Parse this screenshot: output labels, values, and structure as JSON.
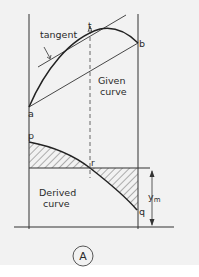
{
  "diagram": {
    "labels": {
      "tangent": "tangent",
      "t": "t",
      "b": "b",
      "a": "a",
      "given_line1": "Given",
      "given_line2": "curve",
      "p": "p",
      "r": "r",
      "q": "q",
      "derived_line1": "Derived",
      "derived_line2": "curve",
      "ym_main": "y",
      "ym_sub": "m",
      "panel": "A"
    },
    "colors": {
      "background": "#f2f2f2",
      "ink": "#2a2a2a",
      "footer": "#ffffff"
    }
  }
}
